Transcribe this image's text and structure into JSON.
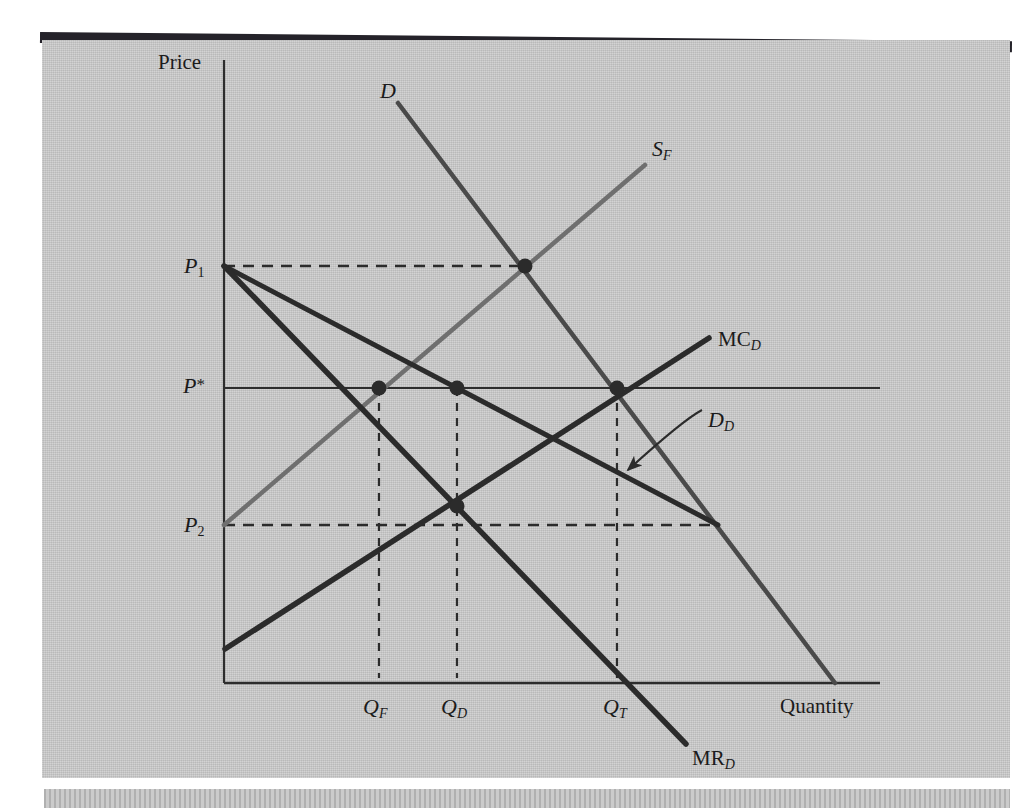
{
  "figure": {
    "type": "economics-diagram",
    "axis": {
      "y_label": "Price",
      "x_label": "Quantity"
    },
    "price_labels": [
      {
        "id": "P1",
        "base": "P",
        "sub": "1",
        "y": 266
      },
      {
        "id": "Pstar",
        "base": "P",
        "sub": "*",
        "y": 386
      },
      {
        "id": "P2",
        "base": "P",
        "sub": "2",
        "y": 525
      }
    ],
    "quantity_labels": [
      {
        "id": "QF",
        "base": "Q",
        "sub": "F",
        "x": 377
      },
      {
        "id": "QD",
        "base": "Q",
        "sub": "D",
        "x": 455
      },
      {
        "id": "QT",
        "base": "Q",
        "sub": "T",
        "x": 617
      }
    ],
    "curve_labels": [
      {
        "id": "D",
        "base": "D",
        "sub": "",
        "style": "italic",
        "x": 380,
        "y": 78
      },
      {
        "id": "SF",
        "base": "S",
        "sub": "F",
        "style": "italic",
        "x": 652,
        "y": 136
      },
      {
        "id": "MCD",
        "base": "MC",
        "sub": "D",
        "style": "upright",
        "x": 718,
        "y": 327
      },
      {
        "id": "DD",
        "base": "D",
        "sub": "D",
        "style": "italic",
        "x": 708,
        "y": 407
      },
      {
        "id": "MRD",
        "base": "MR",
        "sub": "D",
        "style": "upright",
        "x": 692,
        "y": 746
      }
    ],
    "colors": {
      "paper": "#c9c9c9",
      "ink_dark": "#2b2b2b",
      "ink_mid": "#4a4a4a",
      "ink_light": "#6f6f6f",
      "axis": "#2d2d2d",
      "topbar": "#25232a"
    }
  },
  "chart_data": {
    "type": "line",
    "title": "",
    "xlabel": "Quantity",
    "ylabel": "Price",
    "grid": false,
    "legend": "inline-curve-labels",
    "axis_origin_px": {
      "x": 224,
      "y": 683
    },
    "price_levels": {
      "P1": 266,
      "Pstar": 386,
      "P2": 525
    },
    "quantity_levels": {
      "QF": 377,
      "QD": 455,
      "QT": 617
    },
    "series": [
      {
        "name": "D",
        "label": "D",
        "shade": "mid",
        "width": 4.5,
        "points": [
          [
            398,
            103
          ],
          [
            835,
            683
          ]
        ]
      },
      {
        "name": "S_F",
        "label": "S_F",
        "shade": "light",
        "width": 4.5,
        "points": [
          [
            224,
            525
          ],
          [
            645,
            165
          ]
        ]
      },
      {
        "name": "D_D",
        "label": "D_D",
        "shade": "dark",
        "width": 5,
        "points": [
          [
            224,
            266
          ],
          [
            718,
            525
          ]
        ]
      },
      {
        "name": "MR_D",
        "label": "MR_D",
        "shade": "dark",
        "width": 5.5,
        "points": [
          [
            224,
            266
          ],
          [
            686,
            744
          ]
        ]
      },
      {
        "name": "MC_D",
        "label": "MC_D",
        "shade": "dark",
        "width": 5.5,
        "points": [
          [
            225,
            649
          ],
          [
            709,
            338
          ]
        ]
      }
    ],
    "markers": [
      {
        "label": "D x S_F at P1",
        "x": 525,
        "y": 266
      },
      {
        "label": "S_F at P*",
        "x": 379,
        "y": 388
      },
      {
        "label": "MC_D at P*",
        "x": 457,
        "y": 388
      },
      {
        "label": "D at P*",
        "x": 617,
        "y": 388
      },
      {
        "label": "MR_D x MC_D",
        "x": 457,
        "y": 506
      }
    ],
    "solid_lines": [
      {
        "label": "P* horizontal",
        "x1": 224,
        "y1": 388,
        "x2": 880,
        "y2": 388
      }
    ],
    "dashed_horizontals": [
      {
        "label": "P1 level",
        "x1": 224,
        "y1": 266,
        "x2": 525,
        "y2": 266
      },
      {
        "label": "P2 level",
        "x1": 224,
        "y1": 525,
        "x2": 718,
        "y2": 525
      }
    ],
    "dashed_verticals": [
      {
        "label": "QF",
        "x": 379,
        "y1": 388,
        "y2": 678
      },
      {
        "label": "QD",
        "x": 457,
        "y1": 388,
        "y2": 678
      },
      {
        "label": "QT",
        "x": 617,
        "y1": 388,
        "y2": 678
      }
    ],
    "annotation_arrow": {
      "label": "D_D pointer",
      "from": [
        702,
        410
      ],
      "to": [
        628,
        470
      ]
    }
  }
}
